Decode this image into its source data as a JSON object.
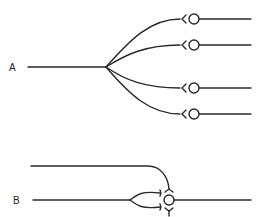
{
  "diagram": {
    "type": "neuron-connectivity",
    "panels": [
      {
        "label": "A",
        "description": "divergence: one input axon branching to four terminals, each synapsing on a separate cell",
        "terminals": 4
      },
      {
        "label": "B",
        "description": "convergence: two input axons (one branching) synapsing onto a single cell",
        "terminals": 4
      }
    ],
    "colors": {
      "line": "#2a2a2a",
      "background": "#ffffff"
    }
  }
}
